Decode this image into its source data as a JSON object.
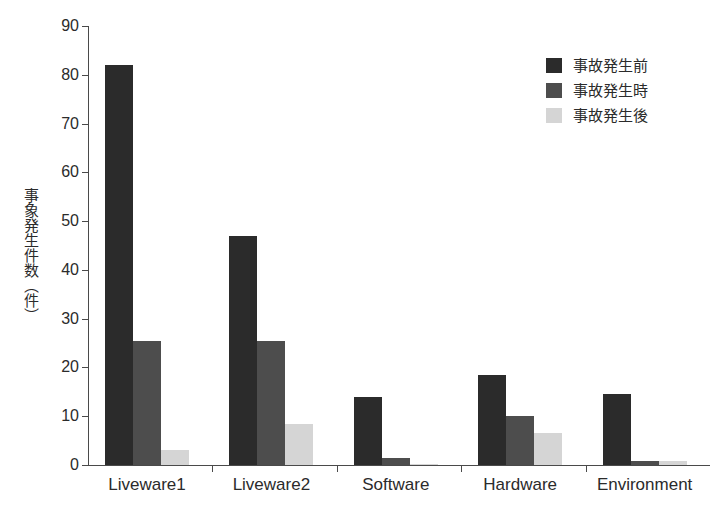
{
  "chart_data": {
    "type": "bar",
    "title": "",
    "xlabel": "",
    "ylabel": "事象発生件数（件）",
    "ylim": [
      0,
      90
    ],
    "ytick_step": 10,
    "yticks": [
      0,
      10,
      20,
      30,
      40,
      50,
      60,
      70,
      80,
      90
    ],
    "ytick_labels": [
      "0",
      "10",
      "20",
      "30",
      "40",
      "50",
      "60",
      "70",
      "80",
      "90"
    ],
    "grid": false,
    "legend_position": "top-right",
    "categories": [
      "Liveware1",
      "Liveware2",
      "Software",
      "Hardware",
      "Environment"
    ],
    "series": [
      {
        "name": "事故発生前",
        "color": "#2b2b2b",
        "values": [
          82,
          47,
          14,
          18.5,
          14.5
        ]
      },
      {
        "name": "事故発生時",
        "color": "#4d4d4d",
        "values": [
          25.5,
          25.5,
          1.5,
          10,
          0.8
        ]
      },
      {
        "name": "事故発生後",
        "color": "#d5d5d5",
        "values": [
          3,
          8.5,
          0.2,
          6.5,
          0.8
        ]
      }
    ]
  },
  "axis": {
    "y_title": "事象発生件数（件）",
    "y_tick_labels": [
      "90",
      "80",
      "70",
      "60",
      "50",
      "40",
      "30",
      "20",
      "10",
      "0"
    ],
    "x_category_labels": [
      "Liveware1",
      "Liveware2",
      "Software",
      "Hardware",
      "Environment"
    ]
  },
  "legend": {
    "items": [
      {
        "label": "事故発生前",
        "color": "#2b2b2b",
        "swatch": "legend-swatch-before"
      },
      {
        "label": "事故発生時",
        "color": "#4d4d4d",
        "swatch": "legend-swatch-during"
      },
      {
        "label": "事故発生後",
        "color": "#d5d5d5",
        "swatch": "legend-swatch-after"
      }
    ]
  }
}
